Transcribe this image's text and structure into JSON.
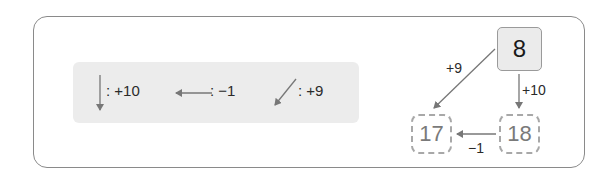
{
  "legend": {
    "items": [
      {
        "icon": "down-arrow-icon",
        "text": ": +10"
      },
      {
        "icon": "left-arrow-icon",
        "text": ": −1"
      },
      {
        "icon": "down-left-arrow-icon",
        "text": ": +9"
      }
    ]
  },
  "diagram": {
    "start_value": "8",
    "edges": {
      "diag_label": "+9",
      "down_label": "+10",
      "left_label": "−1"
    },
    "boxes": {
      "bottom_left": "17",
      "bottom_right": "18"
    }
  },
  "colors": {
    "frame": "#8a8a8a",
    "legend_bg": "#ececec",
    "arrow": "#777777",
    "dashed_box": "#a8a8a8"
  }
}
